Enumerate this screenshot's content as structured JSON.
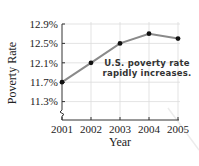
{
  "chart_data": {
    "type": "line",
    "title": "",
    "xlabel": "Year",
    "ylabel": "Poverty Rate",
    "x": [
      "2001",
      "2002",
      "2003",
      "2004",
      "2005"
    ],
    "series": [
      {
        "name": "U.S. poverty rate",
        "values": [
          11.7,
          12.1,
          12.5,
          12.7,
          12.6
        ]
      }
    ],
    "yticks": [
      "11.3%",
      "11.7%",
      "12.1%",
      "12.5%",
      "12.9%"
    ],
    "ytick_values": [
      11.3,
      11.7,
      12.1,
      12.5,
      12.9
    ],
    "ylim": [
      11.3,
      12.9
    ],
    "y_axis_break": true,
    "grid": true,
    "legend": "none",
    "annotations": [
      {
        "text_lines": [
          "U.S. poverty rate",
          "rapidly increases."
        ]
      }
    ],
    "colors": {
      "line": "#8a8a8a",
      "marker": "#111111",
      "grid": "#dcdcdc",
      "axis": "#333333"
    }
  }
}
